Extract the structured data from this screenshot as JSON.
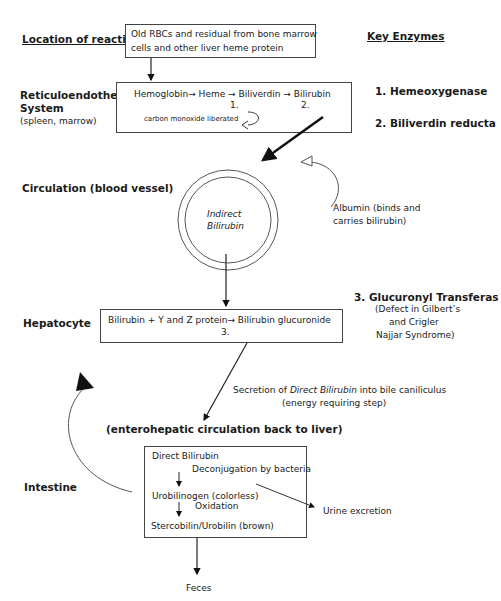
{
  "headers": {
    "location": "Location of reaction",
    "enzymes": "Key Enzymes"
  },
  "locations": {
    "res": {
      "title_line1": "Reticuloendothelial",
      "title_line2": "System",
      "sub": "(spleen, marrow)"
    },
    "circulation": "Circulation (blood vessel)",
    "hepatocyte": "Hepatocyte",
    "enterohepatic": "(enterohepatic circulation back to liver)",
    "intestine": "Intestine"
  },
  "boxes": {
    "source": {
      "line1": "Old RBCs and residual from bone marrow",
      "line2": "cells and other liver heme protein"
    },
    "res": {
      "reaction": "Hemoglobin→ Heme  → Biliverdin  → Bilirubin",
      "step1": "1.",
      "step2": "2.",
      "byproduct": "carbon monoxide liberated"
    },
    "circle": {
      "line1": "Indirect",
      "line2": "Bilirubin"
    },
    "hepatocyte": {
      "reaction": "Bilirubin + Y and Z protein→ Bilirubin glucuronide",
      "step3": "3."
    },
    "intestine": {
      "direct": "Direct Bilirubin",
      "deconj": "Deconjugation by bacteria",
      "urobilinogen": "Urobilinogen (colorless)",
      "oxidation": "Oxidation",
      "stercobilin": "Stercobilin/Urobilin (brown)"
    }
  },
  "enzymes": {
    "e1": "1. Hemeoxygenase",
    "e2": "2. Biliverdin reducta",
    "e3": "3. Glucuronyl Transferas",
    "e3_note1": "(Defect in Gilbert’s",
    "e3_note2": "and Crigler",
    "e3_note3": "Najjar Syndrome)"
  },
  "annotations": {
    "albumin1": "Albumin (binds and",
    "albumin2": "carries bilirubin)",
    "secretion_pre": "Secretion of ",
    "secretion_ital": "Direct Bilirubin",
    "secretion_post": " into bile caniliculus",
    "secretion_note": "(energy requiring step)",
    "urine": "Urine excretion",
    "feces": "Feces"
  }
}
